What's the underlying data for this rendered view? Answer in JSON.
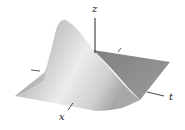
{
  "figure": {
    "axes": {
      "z": {
        "label": "z"
      },
      "t": {
        "label": "t"
      },
      "x": {
        "label": "x"
      }
    },
    "colors": {
      "background": "#ffffff",
      "surface_light": "#e6e6e6",
      "surface_mid": "#b4b4b4",
      "surface_dark": "#8a8a8a",
      "axis": "#333333"
    }
  }
}
